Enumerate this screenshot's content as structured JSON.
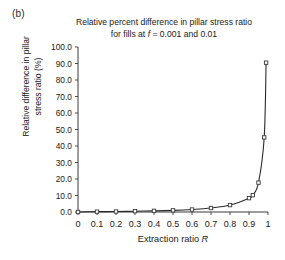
{
  "figure": {
    "panel_label": "(b)",
    "title_line1": "Relative percent difference in pillar stress ratio",
    "title_line2_prefix": "for fills at ",
    "title_line2_f": "f",
    "title_line2_suffix": " = 0.001 and 0.01",
    "xlabel_prefix": "Extraction ratio ",
    "xlabel_symbol": "R",
    "ylabel_line1": "Relative difference in pillar",
    "ylabel_line2": "stress ratio (%)"
  },
  "colors": {
    "axis": "#3a3a3a",
    "curve": "#2a2a2a",
    "marker_fill": "#ffffff",
    "marker_stroke": "#3a3a3a",
    "background": "#ffffff",
    "text": "#1a1a1a"
  },
  "chart_data": {
    "type": "line",
    "title": "Relative percent difference in pillar stress ratio for fills at f = 0.001 and 0.01",
    "xlabel": "Extraction ratio R",
    "ylabel": "Relative difference in pillar stress ratio (%)",
    "xlim": [
      0,
      1
    ],
    "ylim": [
      0,
      100
    ],
    "xticks": [
      0,
      0.1,
      0.2,
      0.3,
      0.4,
      0.5,
      0.6,
      0.7,
      0.8,
      0.9,
      1
    ],
    "xtick_labels": [
      "0",
      "0.1",
      "0.2",
      "0.3",
      "0.4",
      "0.5",
      "0.6",
      "0.7",
      "0.8",
      "0.9",
      "1"
    ],
    "yticks": [
      0,
      10,
      20,
      30,
      40,
      50,
      60,
      70,
      80,
      90,
      100
    ],
    "ytick_labels": [
      "0.0",
      "10.0",
      "20.0",
      "30.0",
      "40.0",
      "50.0",
      "60.0",
      "70.0",
      "80.0",
      "90.0",
      "100.0"
    ],
    "grid": false,
    "legend": false,
    "marker": "square-open",
    "series": [
      {
        "name": "Relative difference in pillar stress ratio",
        "x": [
          0,
          0.1,
          0.2,
          0.3,
          0.4,
          0.5,
          0.6,
          0.7,
          0.8,
          0.9,
          0.92,
          0.95,
          0.98,
          0.99
        ],
        "y": [
          0.0,
          0.2,
          0.3,
          0.5,
          0.7,
          1.0,
          1.5,
          2.4,
          4.2,
          8.4,
          10.2,
          17.8,
          45.2,
          90.5
        ]
      }
    ]
  },
  "geometry": {
    "plot_left": 78,
    "plot_right": 268,
    "plot_top": 47,
    "plot_bottom": 212
  }
}
